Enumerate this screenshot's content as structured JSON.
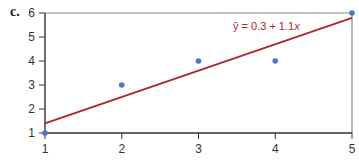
{
  "panel_label": "c.",
  "equation": {
    "prefix": "ŷ = 0.3 + 1.1",
    "var": "x"
  },
  "colors": {
    "regression_line": "#b3232b",
    "points": "#4a78c2",
    "frame": "#888888",
    "axis": "#333333"
  },
  "chart_data": {
    "type": "scatter",
    "title": "",
    "xlabel": "",
    "ylabel": "",
    "xlim": [
      1,
      5
    ],
    "ylim": [
      1,
      6
    ],
    "x_ticks": [
      1,
      2,
      3,
      4,
      5
    ],
    "y_ticks": [
      1,
      2,
      3,
      4,
      5,
      6
    ],
    "grid": false,
    "series": [
      {
        "name": "observed",
        "type": "scatter",
        "x": [
          1,
          2,
          3,
          4,
          5
        ],
        "y": [
          1,
          3,
          4,
          4,
          6
        ]
      },
      {
        "name": "regression line",
        "type": "line",
        "equation": "ŷ = 0.3 + 1.1x",
        "intercept": 0.3,
        "slope": 1.1,
        "x": [
          1,
          5
        ],
        "y": [
          1.4,
          5.8
        ]
      }
    ],
    "annotations": [
      "ŷ = 0.3 + 1.1x"
    ],
    "legend": "none"
  }
}
